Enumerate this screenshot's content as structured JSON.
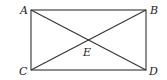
{
  "diagram": {
    "type": "rectangle-with-diagonals",
    "points": {
      "A": {
        "label": "A",
        "x": 31,
        "y": 10
      },
      "B": {
        "label": "B",
        "x": 146,
        "y": 10
      },
      "C": {
        "label": "C",
        "x": 31,
        "y": 70
      },
      "D": {
        "label": "D",
        "x": 146,
        "y": 70
      },
      "E": {
        "label": "E",
        "x": 88.5,
        "y": 40
      }
    },
    "segments": [
      "AB",
      "BD",
      "DC",
      "CA",
      "AD",
      "BC"
    ]
  }
}
